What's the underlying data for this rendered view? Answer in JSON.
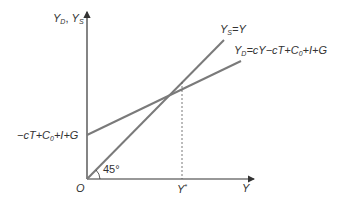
{
  "diagram": {
    "type": "keynesian-cross",
    "axes": {
      "y_label": {
        "main": "Y",
        "sub1": "D",
        "sep": ", ",
        "main2": "Y",
        "sub2": "S"
      },
      "x_label": "Y",
      "origin": "O"
    },
    "lines": {
      "supply": {
        "lhs": "Y",
        "sub": "S",
        "rhs": "=Y"
      },
      "demand": {
        "lhs": "Y",
        "sub": "D",
        "rhs_a": "=cY−cT+C",
        "rhs_sub": "0",
        "rhs_b": "+I+G"
      },
      "intercept": {
        "a": "−cT+C",
        "sub": "0",
        "b": "+I+G"
      }
    },
    "angle_label": "45°",
    "equilibrium": {
      "main": "Y",
      "sup": "*"
    },
    "colors": {
      "axis": "#333333",
      "line": "#7a7a7a",
      "text": "#333333",
      "dashed": "#555555"
    }
  }
}
